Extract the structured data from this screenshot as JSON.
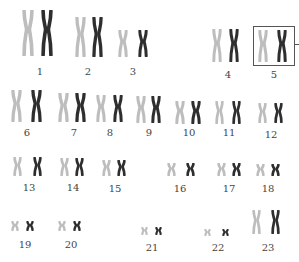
{
  "diagram": {
    "type": "karyotype",
    "colors": {
      "light_chromatid": "#bdbdbd",
      "dark_chromatid": "#2e2e2e",
      "label": "#444444",
      "highlight_box": "#555555"
    },
    "highlighted_pair": "5",
    "pairs": [
      {
        "label": "1",
        "light": {
          "x": 28,
          "y": 10,
          "h": 46,
          "w": 12
        },
        "dark": {
          "x": 47,
          "y": 10,
          "h": 46,
          "w": 12
        },
        "label_pos": {
          "x": 40,
          "y": 67
        }
      },
      {
        "label": "2",
        "light": {
          "x": 80,
          "y": 17,
          "h": 40,
          "w": 11
        },
        "dark": {
          "x": 97,
          "y": 17,
          "h": 40,
          "w": 11
        },
        "label_pos": {
          "x": 88,
          "y": 67
        }
      },
      {
        "label": "3",
        "light": {
          "x": 123,
          "y": 30,
          "h": 27,
          "w": 10
        },
        "dark": {
          "x": 143,
          "y": 30,
          "h": 27,
          "w": 10
        },
        "label_pos": {
          "x": 133,
          "y": 67
        }
      },
      {
        "label": "4",
        "light": {
          "x": 217,
          "y": 29,
          "h": 33,
          "w": 10
        },
        "dark": {
          "x": 234,
          "y": 29,
          "h": 33,
          "w": 10
        },
        "label_pos": {
          "x": 228,
          "y": 70
        }
      },
      {
        "label": "5",
        "light": {
          "x": 263,
          "y": 30,
          "h": 32,
          "w": 10
        },
        "dark": {
          "x": 282,
          "y": 30,
          "h": 32,
          "w": 10
        },
        "label_pos": {
          "x": 274,
          "y": 70
        }
      },
      {
        "label": "6",
        "light": {
          "x": 16,
          "y": 90,
          "h": 32,
          "w": 11
        },
        "dark": {
          "x": 36,
          "y": 90,
          "h": 32,
          "w": 11
        },
        "label_pos": {
          "x": 27,
          "y": 128
        }
      },
      {
        "label": "7",
        "light": {
          "x": 63,
          "y": 93,
          "h": 29,
          "w": 11
        },
        "dark": {
          "x": 80,
          "y": 93,
          "h": 29,
          "w": 11
        },
        "label_pos": {
          "x": 74,
          "y": 128
        }
      },
      {
        "label": "8",
        "light": {
          "x": 101,
          "y": 95,
          "h": 27,
          "w": 10
        },
        "dark": {
          "x": 118,
          "y": 95,
          "h": 27,
          "w": 10
        },
        "label_pos": {
          "x": 110,
          "y": 128
        }
      },
      {
        "label": "9",
        "light": {
          "x": 141,
          "y": 96,
          "h": 27,
          "w": 10
        },
        "dark": {
          "x": 156,
          "y": 96,
          "h": 27,
          "w": 10
        },
        "label_pos": {
          "x": 149,
          "y": 128
        }
      },
      {
        "label": "10",
        "light": {
          "x": 180,
          "y": 101,
          "h": 23,
          "w": 10
        },
        "dark": {
          "x": 196,
          "y": 101,
          "h": 23,
          "w": 10
        },
        "label_pos": {
          "x": 189,
          "y": 128
        }
      },
      {
        "label": "11",
        "light": {
          "x": 219,
          "y": 101,
          "h": 23,
          "w": 9
        },
        "dark": {
          "x": 236,
          "y": 101,
          "h": 23,
          "w": 9
        },
        "label_pos": {
          "x": 229,
          "y": 128
        }
      },
      {
        "label": "12",
        "light": {
          "x": 262,
          "y": 103,
          "h": 20,
          "w": 9
        },
        "dark": {
          "x": 278,
          "y": 103,
          "h": 20,
          "w": 9
        },
        "label_pos": {
          "x": 271,
          "y": 130
        }
      },
      {
        "label": "13",
        "light": {
          "x": 17,
          "y": 157,
          "h": 19,
          "w": 9
        },
        "dark": {
          "x": 37,
          "y": 157,
          "h": 19,
          "w": 9
        },
        "label_pos": {
          "x": 29,
          "y": 183
        }
      },
      {
        "label": "14",
        "light": {
          "x": 64,
          "y": 158,
          "h": 18,
          "w": 9
        },
        "dark": {
          "x": 79,
          "y": 158,
          "h": 18,
          "w": 9
        },
        "label_pos": {
          "x": 73,
          "y": 183
        }
      },
      {
        "label": "15",
        "light": {
          "x": 106,
          "y": 160,
          "h": 16,
          "w": 9
        },
        "dark": {
          "x": 121,
          "y": 160,
          "h": 16,
          "w": 9
        },
        "label_pos": {
          "x": 115,
          "y": 184
        }
      },
      {
        "label": "16",
        "light": {
          "x": 171,
          "y": 163,
          "h": 13,
          "w": 9
        },
        "dark": {
          "x": 190,
          "y": 163,
          "h": 13,
          "w": 9
        },
        "label_pos": {
          "x": 180,
          "y": 184
        }
      },
      {
        "label": "17",
        "light": {
          "x": 221,
          "y": 163,
          "h": 13,
          "w": 9
        },
        "dark": {
          "x": 236,
          "y": 163,
          "h": 13,
          "w": 9
        },
        "label_pos": {
          "x": 229,
          "y": 184
        }
      },
      {
        "label": "18",
        "light": {
          "x": 260,
          "y": 164,
          "h": 12,
          "w": 9
        },
        "dark": {
          "x": 275,
          "y": 164,
          "h": 12,
          "w": 9
        },
        "label_pos": {
          "x": 268,
          "y": 184
        }
      },
      {
        "label": "19",
        "light": {
          "x": 15,
          "y": 221,
          "h": 10,
          "w": 8
        },
        "dark": {
          "x": 30,
          "y": 221,
          "h": 10,
          "w": 8
        },
        "label_pos": {
          "x": 25,
          "y": 240
        }
      },
      {
        "label": "20",
        "light": {
          "x": 62,
          "y": 221,
          "h": 10,
          "w": 8
        },
        "dark": {
          "x": 77,
          "y": 221,
          "h": 10,
          "w": 8
        },
        "label_pos": {
          "x": 71,
          "y": 240
        }
      },
      {
        "label": "21",
        "light": {
          "x": 144,
          "y": 227,
          "h": 8,
          "w": 7
        },
        "dark": {
          "x": 158,
          "y": 227,
          "h": 8,
          "w": 7
        },
        "label_pos": {
          "x": 152,
          "y": 243
        }
      },
      {
        "label": "22",
        "light": {
          "x": 207,
          "y": 229,
          "h": 7,
          "w": 7
        },
        "dark": {
          "x": 225,
          "y": 229,
          "h": 7,
          "w": 7
        },
        "label_pos": {
          "x": 218,
          "y": 243
        }
      },
      {
        "label": "23",
        "light": {
          "x": 256,
          "y": 210,
          "h": 24,
          "w": 9
        },
        "dark": {
          "x": 275,
          "y": 210,
          "h": 24,
          "w": 9
        },
        "label_pos": {
          "x": 268,
          "y": 243
        }
      }
    ]
  }
}
